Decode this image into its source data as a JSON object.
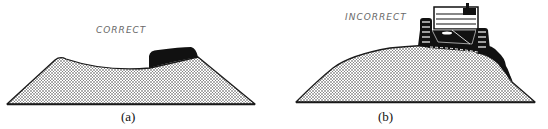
{
  "figure": {
    "panels": [
      {
        "id": "a",
        "annotation": "CORRECT",
        "caption": "(a)",
        "description": "Trapezoidal stockpile with concave top; dark load placed at right shoulder"
      },
      {
        "id": "b",
        "annotation": "INCORRECT",
        "caption": "(b)",
        "description": "Domed stockpile with tracked vehicle on top pushing material over the edge"
      }
    ],
    "colors": {
      "outline": "#1a1a1a",
      "fill_dots": "#3a3a3a",
      "fill_bg": "#ffffff",
      "annotation_text": "#6a6a6a",
      "load": "#111111"
    }
  }
}
